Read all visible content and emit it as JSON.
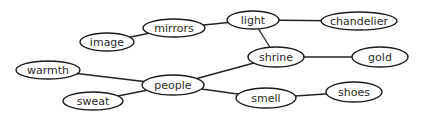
{
  "diagram": {
    "type": "concept-map",
    "nodes": [
      {
        "id": "image",
        "label": "image",
        "cx": 107,
        "cy": 42,
        "rx": 27,
        "ry": 9
      },
      {
        "id": "mirrors",
        "label": "mirrors",
        "cx": 174,
        "cy": 28,
        "rx": 31,
        "ry": 9
      },
      {
        "id": "light",
        "label": "light",
        "cx": 253,
        "cy": 20,
        "rx": 26,
        "ry": 9
      },
      {
        "id": "chandelier",
        "label": "chandelier",
        "cx": 359,
        "cy": 21,
        "rx": 38,
        "ry": 9
      },
      {
        "id": "warmth",
        "label": "warmth",
        "cx": 48,
        "cy": 70,
        "rx": 32,
        "ry": 9
      },
      {
        "id": "sweat",
        "label": "sweat",
        "cx": 93,
        "cy": 101,
        "rx": 30,
        "ry": 9
      },
      {
        "id": "people",
        "label": "people",
        "cx": 173,
        "cy": 85,
        "rx": 31,
        "ry": 10
      },
      {
        "id": "shrine",
        "label": "shrine",
        "cx": 276,
        "cy": 57,
        "rx": 28,
        "ry": 10
      },
      {
        "id": "gold",
        "label": "gold",
        "cx": 380,
        "cy": 57,
        "rx": 28,
        "ry": 10
      },
      {
        "id": "smell",
        "label": "smell",
        "cx": 266,
        "cy": 98,
        "rx": 30,
        "ry": 10
      },
      {
        "id": "shoes",
        "label": "shoes",
        "cx": 354,
        "cy": 92,
        "rx": 28,
        "ry": 10
      }
    ],
    "edges": [
      {
        "from": "image",
        "to": "mirrors"
      },
      {
        "from": "mirrors",
        "to": "light"
      },
      {
        "from": "light",
        "to": "chandelier"
      },
      {
        "from": "light",
        "to": "shrine"
      },
      {
        "from": "shrine",
        "to": "gold"
      },
      {
        "from": "people",
        "to": "shrine"
      },
      {
        "from": "people",
        "to": "smell"
      },
      {
        "from": "smell",
        "to": "shoes"
      },
      {
        "from": "warmth",
        "to": "people"
      },
      {
        "from": "sweat",
        "to": "people"
      }
    ],
    "colors": {
      "background": "#ffffff",
      "stroke": "#1a1a1a",
      "text": "#2a2a2a"
    }
  }
}
